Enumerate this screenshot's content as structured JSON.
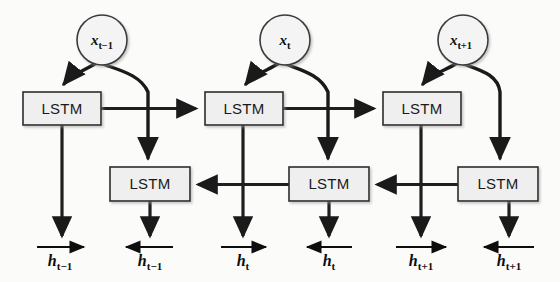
{
  "figure": {
    "background_color": "#fbfbfa",
    "node_fill": "#efefef",
    "stroke_color": "#1f1f1f"
  },
  "inputs": [
    {
      "name": "input-x-t-minus-1",
      "base": "x",
      "sub": "t−1",
      "cx": 102,
      "cy": 40,
      "r": 25
    },
    {
      "name": "input-x-t",
      "base": "x",
      "sub": "t",
      "cx": 285,
      "cy": 40,
      "r": 25
    },
    {
      "name": "input-x-t-plus-1",
      "base": "x",
      "sub": "t+1",
      "cx": 463,
      "cy": 40,
      "r": 25
    }
  ],
  "forward_cells": [
    {
      "label": "LSTM",
      "x": 23,
      "y": 92,
      "w": 78,
      "h": 33
    },
    {
      "label": "LSTM",
      "x": 205,
      "y": 92,
      "w": 78,
      "h": 33
    },
    {
      "label": "LSTM",
      "x": 383,
      "y": 92,
      "w": 78,
      "h": 33
    }
  ],
  "backward_cells": [
    {
      "label": "LSTM",
      "x": 110,
      "y": 167,
      "w": 80,
      "h": 34
    },
    {
      "label": "LSTM",
      "x": 289,
      "y": 167,
      "w": 80,
      "h": 34
    },
    {
      "label": "LSTM",
      "x": 458,
      "y": 167,
      "w": 80,
      "h": 34
    }
  ],
  "outputs": [
    {
      "name": "output-h-t-minus-1-forward",
      "base": "h",
      "sub": "t−1",
      "direction": "forward",
      "x": 62,
      "y": 258
    },
    {
      "name": "output-h-t-minus-1-backward",
      "base": "h",
      "sub": "t−1",
      "direction": "backward",
      "x": 150,
      "y": 258
    },
    {
      "name": "output-h-t-forward",
      "base": "h",
      "sub": "t",
      "direction": "forward",
      "x": 243,
      "y": 258
    },
    {
      "name": "output-h-t-backward",
      "base": "h",
      "sub": "t",
      "direction": "backward",
      "x": 329,
      "y": 258
    },
    {
      "name": "output-h-t-plus-1-forward",
      "base": "h",
      "sub": "t+1",
      "direction": "forward",
      "x": 421,
      "y": 258
    },
    {
      "name": "output-h-t-plus-1-backward",
      "base": "h",
      "sub": "t+1",
      "direction": "backward",
      "x": 509,
      "y": 258
    }
  ],
  "legend": {
    "forward_layer": "Forward LSTM layer",
    "backward_layer": "Backward LSTM layer"
  }
}
